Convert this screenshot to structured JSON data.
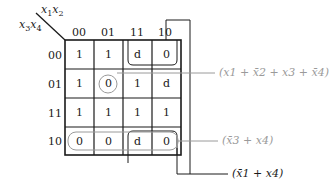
{
  "kmap": {
    "row_var_label": "x3x4",
    "col_var_label": "x1x2",
    "col_headers": [
      "00",
      "01",
      "11",
      "10"
    ],
    "row_headers": [
      "00",
      "01",
      "11",
      "10"
    ],
    "cells": [
      [
        "1",
        "1",
        "d",
        "0"
      ],
      [
        "1",
        "0",
        "1",
        "d"
      ],
      [
        "1",
        "1",
        "1",
        "1"
      ],
      [
        "0",
        "0",
        "d",
        "0"
      ]
    ]
  },
  "groupings": [
    {
      "name": "maxterm-single",
      "cells": [
        [
          1,
          1
        ]
      ],
      "expression": "(x1 + x̄2 + x3 + x̄4)",
      "color": "#9a9a9a"
    },
    {
      "name": "row-10",
      "cells": [
        [
          3,
          0
        ],
        [
          3,
          1
        ],
        [
          3,
          2
        ],
        [
          3,
          3
        ]
      ],
      "expression": "(x̄3 + x4)",
      "color": "#9a9a9a"
    },
    {
      "name": "columns-11-10-corners",
      "cells": [
        [
          0,
          2
        ],
        [
          0,
          3
        ],
        [
          3,
          2
        ],
        [
          3,
          3
        ]
      ],
      "expression": "(x̄1 + x4)",
      "color": "#1a1a1a"
    }
  ]
}
